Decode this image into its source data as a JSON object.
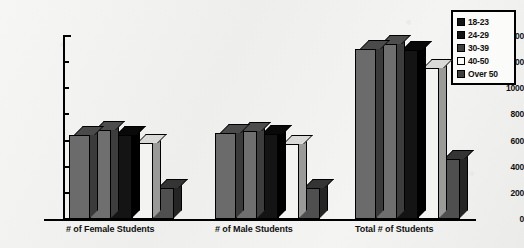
{
  "chart_data": {
    "type": "bar",
    "title": "",
    "subtitle": "",
    "xlabel": "",
    "ylabel": "",
    "ylim": [
      0,
      1400
    ],
    "yticks": [
      0,
      200,
      400,
      600,
      800,
      1000,
      1200,
      1400
    ],
    "grid": false,
    "legend_position": "top-right",
    "categories": [
      "# of Female Students",
      "# of Male Students",
      "Total # of Students"
    ],
    "series": [
      {
        "name": "18-23",
        "color": "#6b6b6b",
        "values": [
          640,
          660,
          1300
        ]
      },
      {
        "name": "24-29",
        "color": "#6f6f6f",
        "values": [
          680,
          670,
          1340
        ]
      },
      {
        "name": "30-39",
        "color": "#141414",
        "values": [
          640,
          650,
          1290
        ]
      },
      {
        "name": "40-50",
        "color": "#f3f3f1",
        "values": [
          580,
          575,
          1155
        ]
      },
      {
        "name": "Over 50",
        "color": "#4f4f4f",
        "values": [
          240,
          235,
          460
        ]
      }
    ]
  },
  "legend": {
    "items": [
      {
        "label": "18-23"
      },
      {
        "label": "24-29"
      },
      {
        "label": "30-39"
      },
      {
        "label": "40-50"
      },
      {
        "label": "Over 50"
      }
    ]
  },
  "axis": {
    "y_tick_labels": [
      "1400",
      "1200",
      "1000",
      "800",
      "600",
      "400",
      "200",
      "0"
    ]
  }
}
